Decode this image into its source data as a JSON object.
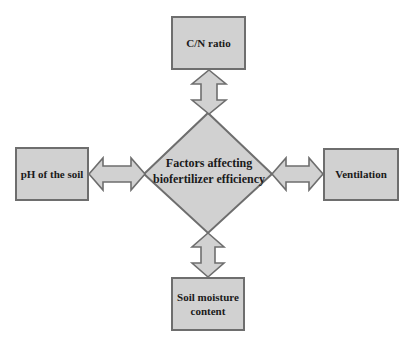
{
  "diagram": {
    "type": "hub-and-spoke",
    "center": {
      "label_line1": "Factors affecting",
      "label_line2": "biofertilizer efficiency",
      "shape": "diamond"
    },
    "nodes": {
      "top": {
        "label": "C/N ratio"
      },
      "left": {
        "label": "pH of the soil"
      },
      "right": {
        "label": "Ventilation"
      },
      "bottom": {
        "label_line1": "Soil moisture",
        "label_line2": "content"
      }
    },
    "connectors": "double-headed block arrows",
    "colors": {
      "fill": "#d1d1d1",
      "stroke": "#6e6e6e",
      "text": "#1a1a1a",
      "background": "#ffffff"
    }
  }
}
